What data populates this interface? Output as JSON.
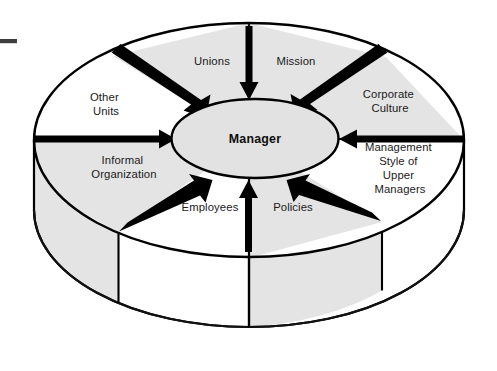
{
  "diagram": {
    "type": "radial-cylinder-diagram",
    "center": {
      "label": "Manager",
      "shape": "ellipse",
      "fill": "#e2e2e2"
    },
    "marker": {
      "name": "crop-dash",
      "color": "#3f3f3f"
    },
    "colors": {
      "shaded_segment": "#e4e4e4",
      "plain_segment": "#ffffff",
      "outline": "#000000",
      "text": "#1a1a1a"
    },
    "segments": [
      {
        "id": "unions",
        "label": "Unions",
        "lines": [
          "Unions"
        ],
        "shaded": true,
        "label_x": 212,
        "label_y": 65,
        "arrow": "diagonal-down-right"
      },
      {
        "id": "mission",
        "label": "Mission",
        "lines": [
          "Mission"
        ],
        "shaded": false,
        "label_x": 296,
        "label_y": 65,
        "arrow": "down"
      },
      {
        "id": "corporate-culture",
        "label": "Corporate Culture",
        "lines": [
          "Corporate",
          "Culture"
        ],
        "shaded": true,
        "label_x": 390,
        "label_y": 98,
        "arrow": "diagonal-down-left"
      },
      {
        "id": "management-style",
        "label": "Management Style of Upper Managers",
        "lines": [
          "Management",
          "Style of",
          "Upper",
          "Managers"
        ],
        "shaded": false,
        "label_x": 400,
        "label_y": 151,
        "arrow": "left"
      },
      {
        "id": "policies",
        "label": "Policies",
        "lines": [
          "Policies"
        ],
        "shaded": true,
        "label_x": 293,
        "label_y": 211,
        "arrow": "up"
      },
      {
        "id": "employees",
        "label": "Employees",
        "lines": [
          "Employees"
        ],
        "shaded": false,
        "label_x": 210,
        "label_y": 211,
        "arrow": "diagonal-up-right"
      },
      {
        "id": "informal-organization",
        "label": "Informal Organization",
        "lines": [
          "Informal",
          "Organization"
        ],
        "shaded": true,
        "label_x": 124,
        "label_y": 164,
        "arrow": "diagonal-up-right"
      },
      {
        "id": "other-units",
        "label": "Other Units",
        "lines": [
          "Other",
          "Units"
        ],
        "shaded": false,
        "label_x": 106,
        "label_y": 100,
        "arrow": "right"
      }
    ]
  }
}
